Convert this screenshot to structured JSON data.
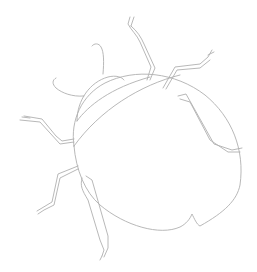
{
  "image": {
    "subject": "beetle line drawing",
    "width": 257,
    "height": 272,
    "background": "#ffffff",
    "stroke_color": "#b0b0b0",
    "stroke_width": 0.9
  },
  "parts": {
    "body": "body outline",
    "head": "head",
    "pronotum": "pronotum",
    "elytra_seam": "elytra seam",
    "antenna_left": "left antenna",
    "antenna_right": "right antenna",
    "legs": [
      "front-left leg",
      "mid-left leg",
      "hind-left leg",
      "front-right leg",
      "mid-right leg",
      "hind-right leg"
    ]
  }
}
